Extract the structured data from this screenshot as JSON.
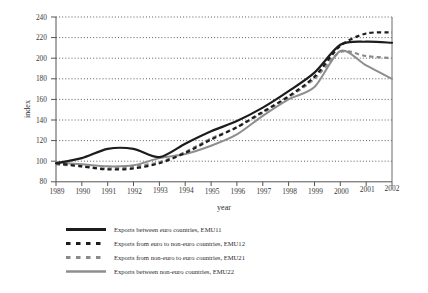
{
  "chart_data": {
    "type": "line",
    "title": "",
    "xlabel": "year",
    "ylabel": "index",
    "x": [
      1989,
      1990,
      1991,
      1992,
      1993,
      1994,
      1995,
      1996,
      1997,
      1998,
      1999,
      2000,
      2001,
      2002
    ],
    "xtick_labels": [
      "1989",
      "1990",
      "1991",
      "1992",
      "1993",
      "1994",
      "1995",
      "1996",
      "1997",
      "1998",
      "1999",
      "2000",
      "2001",
      "2002"
    ],
    "ytick_labels": [
      "80",
      "100",
      "120",
      "140",
      "160",
      "180",
      "200",
      "220",
      "240"
    ],
    "ylim": [
      80,
      240
    ],
    "xlim": [
      1989,
      2002
    ],
    "ytick_step": 20,
    "grid": "horizontal-dotted",
    "legend_position": "below-plot-left",
    "series": [
      {
        "name": "Exports between euro countries, EMU11",
        "key": "EMU11",
        "style": "solid",
        "color": "#1c1c1c",
        "values": [
          98,
          103,
          112,
          112,
          104,
          117,
          129,
          139,
          152,
          168,
          186,
          213,
          216,
          215
        ]
      },
      {
        "name": "Exports from euro to non-euro countries, EMU12",
        "key": "EMU12",
        "style": "dashed",
        "color": "#1c1c1c",
        "values": [
          98,
          95,
          92,
          93,
          98,
          108,
          121,
          133,
          148,
          163,
          182,
          212,
          224,
          225
        ]
      },
      {
        "name": "Exports from non-euro to euro countries, EMU21",
        "key": "EMU21",
        "style": "dashed",
        "color": "#8a8a8a",
        "values": [
          97,
          95,
          93,
          95,
          99,
          109,
          122,
          133,
          147,
          162,
          180,
          206,
          202,
          200
        ]
      },
      {
        "name": "Exports between non-euro countries, EMU22",
        "key": "EMU22",
        "style": "solid",
        "color": "#8e8e8e",
        "values": [
          99,
          97,
          95,
          96,
          103,
          107,
          115,
          126,
          144,
          160,
          172,
          207,
          193,
          180
        ]
      }
    ]
  },
  "axes": {
    "y_title": "index",
    "x_title": "year"
  },
  "legend": {
    "items": [
      {
        "label": "Exports between euro countries, EMU11",
        "swatch": "solid-dark-line-icon"
      },
      {
        "label": "Exports from euro to non-euro countries, EMU12",
        "swatch": "dashed-dark-line-icon"
      },
      {
        "label": "Exports from non-euro to euro countries, EMU21",
        "swatch": "dashed-gray-line-icon"
      },
      {
        "label": "Exports between non-euro countries, EMU22",
        "swatch": "solid-gray-line-icon"
      }
    ]
  }
}
